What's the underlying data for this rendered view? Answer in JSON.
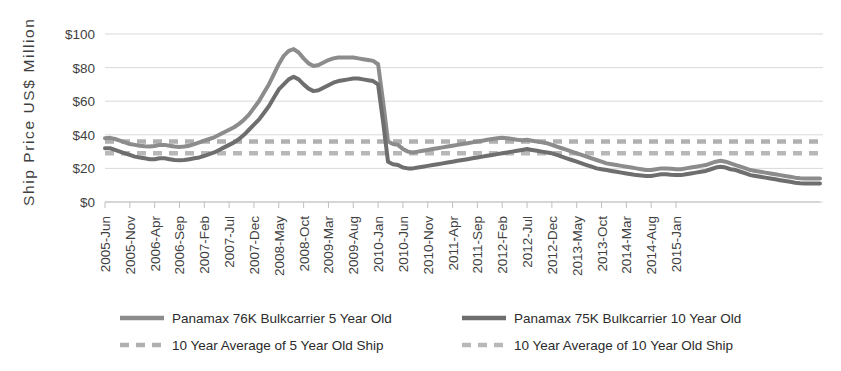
{
  "chart_data": {
    "type": "line",
    "title": "",
    "xlabel": "",
    "ylabel": "Ship  Price  US$  Million",
    "ylim": [
      0,
      100
    ],
    "ytick_values": [
      0,
      20,
      40,
      60,
      80,
      100
    ],
    "ytick_labels": [
      "$0",
      "$20",
      "$40",
      "$60",
      "$80",
      "$100"
    ],
    "grid": true,
    "legend_position": "bottom",
    "x_tick_labels": [
      "2005-Jun",
      "2005-Nov",
      "2006-Apr",
      "2006-Sep",
      "2007-Feb",
      "2007-Jul",
      "2007-Dec",
      "2008-May",
      "2008-Oct",
      "2009-Mar",
      "2009-Aug",
      "2010-Jan",
      "2010-Jun",
      "2010-Nov",
      "2011-Apr",
      "2011-Sep",
      "2012-Feb",
      "2012-Jul",
      "2012-Dec",
      "2013-May",
      "2013-Oct",
      "2014-Mar",
      "2014-Aug",
      "2015-Jan"
    ],
    "x_tick_interval_months": 5,
    "x_start": "2005-Jun",
    "x_end": "2015-Jun",
    "series": [
      {
        "name": "Panamax 76K Bulkcarrier 5 Year Old",
        "style": "solid",
        "color": "#8c8c8c",
        "values": [
          38.0,
          38.2,
          37.5,
          36.5,
          35.5,
          34.5,
          34.0,
          33.5,
          33.2,
          33.0,
          33.3,
          34.0,
          34.0,
          33.5,
          33.0,
          32.8,
          33.0,
          33.5,
          34.5,
          35.5,
          36.5,
          37.5,
          38.5,
          40.0,
          41.5,
          43.0,
          44.5,
          46.5,
          49.0,
          52.0,
          56.0,
          60.0,
          65.0,
          70.0,
          76.0,
          82.0,
          87.0,
          90.0,
          91.0,
          89.0,
          85.5,
          82.5,
          81.0,
          81.5,
          83.0,
          84.5,
          85.5,
          86.0,
          86.0,
          86.0,
          86.0,
          85.5,
          85.0,
          84.5,
          84.0,
          82.0,
          60.0,
          36.0,
          34.5,
          34.0,
          31.5,
          30.0,
          29.5,
          30.0,
          30.5,
          31.0,
          31.5,
          32.0,
          32.5,
          33.0,
          33.5,
          34.0,
          34.5,
          35.0,
          35.5,
          36.0,
          36.5,
          37.0,
          37.5,
          38.0,
          38.2,
          38.0,
          37.5,
          37.0,
          36.8,
          37.0,
          36.5,
          36.0,
          35.5,
          35.0,
          34.0,
          33.0,
          32.0,
          31.0,
          30.0,
          29.0,
          28.0,
          27.0,
          26.0,
          25.0,
          24.0,
          23.0,
          22.5,
          22.0,
          21.5,
          21.0,
          20.5,
          20.0,
          19.5,
          19.0,
          19.0,
          19.5,
          20.0,
          20.0,
          19.8,
          19.5,
          19.5,
          20.0,
          20.5,
          21.0,
          21.5,
          22.0,
          23.0,
          24.0,
          24.5,
          24.0,
          23.0,
          22.0,
          21.0,
          20.0,
          19.0,
          18.5,
          18.0,
          17.5,
          17.0,
          16.5,
          16.0,
          15.5,
          15.0,
          14.5,
          14.2,
          14.0,
          14.0,
          14.0,
          14.0
        ]
      },
      {
        "name": "Panamax 75K Bulkcarrier 10 Year Old",
        "style": "solid",
        "color": "#6e6e6e",
        "values": [
          32.0,
          32.0,
          31.0,
          30.0,
          29.0,
          28.0,
          27.0,
          26.5,
          26.0,
          25.5,
          25.5,
          26.0,
          26.0,
          25.5,
          25.0,
          24.8,
          25.0,
          25.5,
          26.0,
          26.5,
          27.5,
          28.5,
          29.5,
          31.0,
          32.5,
          34.0,
          35.5,
          37.5,
          40.0,
          43.0,
          46.0,
          49.0,
          53.0,
          57.0,
          62.0,
          67.0,
          70.0,
          73.0,
          74.5,
          73.0,
          70.0,
          67.5,
          66.0,
          66.5,
          68.0,
          69.5,
          71.0,
          72.0,
          72.5,
          73.0,
          73.5,
          73.5,
          73.0,
          72.5,
          72.0,
          70.0,
          48.0,
          24.0,
          22.5,
          22.0,
          20.5,
          20.0,
          20.0,
          20.5,
          21.0,
          21.5,
          22.0,
          22.5,
          23.0,
          23.5,
          24.0,
          24.5,
          25.0,
          25.5,
          26.0,
          26.5,
          27.0,
          27.5,
          28.0,
          28.5,
          29.0,
          29.5,
          30.0,
          30.5,
          31.0,
          31.5,
          31.0,
          30.5,
          30.0,
          29.5,
          29.0,
          28.0,
          27.0,
          26.0,
          25.0,
          24.0,
          23.0,
          22.0,
          21.0,
          20.0,
          19.5,
          19.0,
          18.5,
          18.0,
          17.5,
          17.0,
          16.5,
          16.0,
          15.8,
          15.5,
          15.5,
          16.0,
          16.5,
          16.5,
          16.2,
          16.0,
          16.0,
          16.5,
          17.0,
          17.5,
          18.0,
          18.5,
          19.5,
          20.5,
          21.0,
          20.5,
          19.5,
          19.0,
          18.0,
          17.0,
          16.0,
          15.5,
          15.0,
          14.5,
          14.0,
          13.5,
          13.0,
          12.5,
          12.0,
          11.5,
          11.2,
          11.0,
          11.0,
          11.0,
          11.0
        ]
      }
    ],
    "reference_lines": [
      {
        "name": "10 Year Average of 5 Year Old Ship",
        "style": "dashed",
        "color": "#b0b0b0",
        "value": 36.0
      },
      {
        "name": "10 Year Average of 10 Year Old Ship",
        "style": "dashed",
        "color": "#b8b8b8",
        "value": 29.0
      }
    ]
  },
  "legend": {
    "entries": [
      {
        "label": "Panamax 76K Bulkcarrier 5 Year Old",
        "style": "solid",
        "color": "#8c8c8c"
      },
      {
        "label": "Panamax 75K Bulkcarrier 10 Year Old",
        "style": "solid",
        "color": "#6e6e6e"
      },
      {
        "label": "10 Year Average of 5 Year Old Ship",
        "style": "dashed",
        "color": "#b0b0b0"
      },
      {
        "label": "10 Year Average of 10 Year Old Ship",
        "style": "dashed",
        "color": "#b8b8b8"
      }
    ]
  }
}
